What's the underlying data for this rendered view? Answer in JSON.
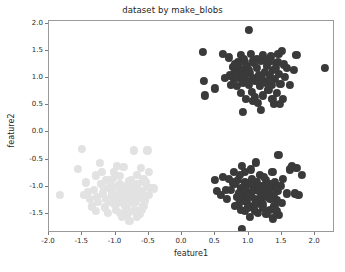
{
  "figure": {
    "width": 345,
    "height": 272,
    "background": "#ffffff"
  },
  "chart_data": {
    "type": "scatter",
    "title": "dataset by make_blobs",
    "xlabel": "feature1",
    "ylabel": "feature2",
    "xlim": [
      -2.0,
      2.3
    ],
    "ylim": [
      -1.85,
      2.05
    ],
    "grid": false,
    "legend": null,
    "xticks": [
      -2.0,
      -1.5,
      -1.0,
      -0.5,
      0.0,
      0.5,
      1.0,
      1.5,
      2.0
    ],
    "xticklabels": [
      "-2.0",
      "-1.5",
      "-1.0",
      "-0.5",
      "0.0",
      "0.5",
      "1.0",
      "1.5",
      "2.0"
    ],
    "yticks": [
      -1.5,
      -1.0,
      -0.5,
      0.0,
      0.5,
      1.0,
      1.5,
      2.0
    ],
    "yticklabels": [
      "-1.5",
      "-1.0",
      "-0.5",
      "0.0",
      "0.5",
      "1.0",
      "1.5",
      "2.0"
    ],
    "marker_size": 8.2,
    "series": [
      {
        "name": "cluster-0",
        "color": "#e2e2e2",
        "center": [
          -1.0,
          -1.05
        ],
        "points": [
          [
            -1.5,
            -0.3
          ],
          [
            -1.84,
            -1.15
          ],
          [
            -1.56,
            -0.67
          ],
          [
            -1.42,
            -1.1
          ],
          [
            -1.3,
            -0.79
          ],
          [
            -1.24,
            -0.56
          ],
          [
            -1.18,
            -1.02
          ],
          [
            -1.14,
            -1.22
          ],
          [
            -1.1,
            -0.88
          ],
          [
            -1.06,
            -1.12
          ],
          [
            -1.02,
            -0.72
          ],
          [
            -0.99,
            -1.0
          ],
          [
            -0.96,
            -1.3
          ],
          [
            -0.93,
            -0.95
          ],
          [
            -0.9,
            -1.18
          ],
          [
            -0.88,
            -0.64
          ],
          [
            -0.86,
            -1.05
          ],
          [
            -0.83,
            -1.42
          ],
          [
            -0.8,
            -0.9
          ],
          [
            -0.78,
            -1.12
          ],
          [
            -0.75,
            -1.3
          ],
          [
            -0.72,
            -0.33
          ],
          [
            -0.7,
            -1.0
          ],
          [
            -0.68,
            -0.78
          ],
          [
            -0.65,
            -1.2
          ],
          [
            -0.62,
            -0.65
          ],
          [
            -0.6,
            -1.07
          ],
          [
            -0.58,
            -1.35
          ],
          [
            -0.55,
            -0.92
          ],
          [
            -0.52,
            -0.33
          ],
          [
            -0.5,
            -1.15
          ],
          [
            -0.47,
            -1.02
          ],
          [
            -0.42,
            -1.03
          ],
          [
            -1.36,
            -1.36
          ],
          [
            -1.28,
            -1.18
          ],
          [
            -1.22,
            -0.95
          ],
          [
            -1.16,
            -1.38
          ],
          [
            -1.08,
            -1.28
          ],
          [
            -1.04,
            -0.86
          ],
          [
            -1.0,
            -1.42
          ],
          [
            -0.97,
            -1.15
          ],
          [
            -0.94,
            -0.8
          ],
          [
            -0.91,
            -1.55
          ],
          [
            -0.87,
            -1.3
          ],
          [
            -0.84,
            -0.98
          ],
          [
            -0.81,
            -1.2
          ],
          [
            -0.79,
            -1.62
          ],
          [
            -0.76,
            -1.05
          ],
          [
            -0.73,
            -1.45
          ],
          [
            -0.7,
            -1.28
          ],
          [
            -0.67,
            -0.95
          ],
          [
            -0.64,
            -1.5
          ],
          [
            -0.61,
            -1.12
          ],
          [
            -0.58,
            -0.85
          ],
          [
            -0.56,
            -1.25
          ],
          [
            -0.53,
            -1.0
          ],
          [
            -1.45,
            -0.92
          ],
          [
            -1.33,
            -1.05
          ],
          [
            -1.26,
            -1.28
          ],
          [
            -1.2,
            -0.72
          ],
          [
            -1.12,
            -1.48
          ],
          [
            -1.05,
            -1.2
          ],
          [
            -0.98,
            -0.62
          ],
          [
            -0.92,
            -1.08
          ],
          [
            -0.85,
            -1.35
          ],
          [
            -0.77,
            -0.88
          ],
          [
            -0.69,
            -1.42
          ],
          [
            -0.63,
            -1.18
          ],
          [
            -1.38,
            -1.22
          ],
          [
            -1.15,
            -0.88
          ],
          [
            -1.02,
            -1.32
          ],
          [
            -0.89,
            -1.0
          ],
          [
            -0.82,
            -1.5
          ],
          [
            -0.74,
            -1.2
          ],
          [
            -0.66,
            -1.08
          ],
          [
            -0.6,
            -1.42
          ],
          [
            -1.1,
            -1.02
          ],
          [
            -0.95,
            -1.25
          ],
          [
            -0.86,
            -1.15
          ],
          [
            -0.71,
            -1.12
          ],
          [
            -1.19,
            -1.12
          ],
          [
            -1.07,
            -0.98
          ],
          [
            -0.93,
            -1.48
          ],
          [
            -0.8,
            -1.05
          ],
          [
            -0.68,
            -1.55
          ],
          [
            -1.3,
            -1.45
          ],
          [
            -1.47,
            -1.15
          ],
          [
            -0.5,
            -0.72
          ]
        ]
      },
      {
        "name": "cluster-1",
        "color": "#3a3a3a",
        "center": [
          1.05,
          1.0
        ],
        "points": [
          [
            0.32,
            1.48
          ],
          [
            0.33,
            0.95
          ],
          [
            0.35,
            0.68
          ],
          [
            0.5,
            0.81
          ],
          [
            0.62,
            1.45
          ],
          [
            0.72,
            1.05
          ],
          [
            0.76,
            1.2
          ],
          [
            0.78,
            0.98
          ],
          [
            0.8,
            1.12
          ],
          [
            0.82,
            0.86
          ],
          [
            0.84,
            1.3
          ],
          [
            0.86,
            1.0
          ],
          [
            0.88,
            0.72
          ],
          [
            0.9,
            1.15
          ],
          [
            0.92,
            0.92
          ],
          [
            0.93,
            1.35
          ],
          [
            0.95,
            1.05
          ],
          [
            0.96,
            0.62
          ],
          [
            0.98,
            1.22
          ],
          [
            1.0,
            0.88
          ],
          [
            1.0,
            1.88
          ],
          [
            1.02,
            1.1
          ],
          [
            1.03,
            1.45
          ],
          [
            1.05,
            0.75
          ],
          [
            1.06,
            1.0
          ],
          [
            1.08,
            1.28
          ],
          [
            1.1,
            0.95
          ],
          [
            1.12,
            1.18
          ],
          [
            1.14,
            0.55
          ],
          [
            1.15,
            1.05
          ],
          [
            1.17,
            0.85
          ],
          [
            1.18,
            1.32
          ],
          [
            1.2,
            1.0
          ],
          [
            1.22,
            0.68
          ],
          [
            1.24,
            1.12
          ],
          [
            1.26,
            0.92
          ],
          [
            1.28,
            1.22
          ],
          [
            1.3,
            0.78
          ],
          [
            1.32,
            1.05
          ],
          [
            1.34,
            1.4
          ],
          [
            1.35,
            0.88
          ],
          [
            1.37,
            1.15
          ],
          [
            1.38,
            0.52
          ],
          [
            1.4,
            0.98
          ],
          [
            1.42,
            1.28
          ],
          [
            1.43,
            0.72
          ],
          [
            1.45,
            1.45
          ],
          [
            1.46,
            1.08
          ],
          [
            1.48,
            0.9
          ],
          [
            1.5,
            1.5
          ],
          [
            1.52,
            0.62
          ],
          [
            1.55,
            1.02
          ],
          [
            1.58,
            1.18
          ],
          [
            1.62,
            0.88
          ],
          [
            1.68,
            1.15
          ],
          [
            1.72,
            1.42
          ],
          [
            2.15,
            1.18
          ],
          [
            0.7,
            1.38
          ],
          [
            0.88,
            1.42
          ],
          [
            1.12,
            1.35
          ],
          [
            0.74,
            0.88
          ],
          [
            0.86,
            1.2
          ],
          [
            0.95,
            1.3
          ],
          [
            1.06,
            0.58
          ],
          [
            1.18,
            0.42
          ],
          [
            0.92,
            0.38
          ],
          [
            1.25,
            1.35
          ],
          [
            1.44,
            1.3
          ],
          [
            0.8,
            1.25
          ],
          [
            1.0,
            1.15
          ],
          [
            1.1,
            0.65
          ],
          [
            1.3,
            1.3
          ],
          [
            0.83,
            1.05
          ],
          [
            0.97,
            0.95
          ],
          [
            1.07,
            1.32
          ],
          [
            1.16,
            0.95
          ],
          [
            1.36,
            0.62
          ],
          [
            1.47,
            0.52
          ],
          [
            1.53,
            1.25
          ],
          [
            0.65,
            1.0
          ],
          [
            1.22,
            1.42
          ],
          [
            1.41,
            1.18
          ],
          [
            0.91,
            1.08
          ],
          [
            1.31,
            0.95
          ]
        ]
      },
      {
        "name": "cluster-2",
        "color": "#3a3a3a",
        "center": [
          1.1,
          -1.0
        ],
        "points": [
          [
            0.5,
            -0.88
          ],
          [
            0.52,
            -1.08
          ],
          [
            0.58,
            -1.15
          ],
          [
            0.62,
            -0.82
          ],
          [
            0.7,
            -0.85
          ],
          [
            0.74,
            -1.05
          ],
          [
            0.78,
            -0.72
          ],
          [
            0.8,
            -0.95
          ],
          [
            0.82,
            -1.18
          ],
          [
            0.84,
            -0.88
          ],
          [
            0.86,
            -1.32
          ],
          [
            0.88,
            -1.02
          ],
          [
            0.9,
            -0.62
          ],
          [
            0.9,
            -1.78
          ],
          [
            0.92,
            -1.15
          ],
          [
            0.94,
            -0.92
          ],
          [
            0.95,
            -1.45
          ],
          [
            0.96,
            -1.05
          ],
          [
            0.98,
            -1.28
          ],
          [
            1.0,
            -0.95
          ],
          [
            1.02,
            -1.55
          ],
          [
            1.03,
            -1.12
          ],
          [
            1.05,
            -0.85
          ],
          [
            1.06,
            -1.35
          ],
          [
            1.08,
            -1.0
          ],
          [
            1.1,
            -1.22
          ],
          [
            1.12,
            -0.92
          ],
          [
            1.14,
            -1.48
          ],
          [
            1.15,
            -1.08
          ],
          [
            1.17,
            -0.78
          ],
          [
            1.18,
            -1.25
          ],
          [
            1.2,
            -0.98
          ],
          [
            1.22,
            -1.38
          ],
          [
            1.24,
            -1.05
          ],
          [
            1.26,
            -0.88
          ],
          [
            1.28,
            -1.18
          ],
          [
            1.3,
            -0.95
          ],
          [
            1.32,
            -1.42
          ],
          [
            1.34,
            -1.02
          ],
          [
            1.36,
            -0.72
          ],
          [
            1.38,
            -1.15
          ],
          [
            1.4,
            -0.92
          ],
          [
            1.42,
            -1.45
          ],
          [
            1.44,
            -1.08
          ],
          [
            1.45,
            -0.42
          ],
          [
            1.46,
            -1.52
          ],
          [
            1.48,
            -0.98
          ],
          [
            1.5,
            -1.3
          ],
          [
            1.52,
            -0.85
          ],
          [
            1.58,
            -1.12
          ],
          [
            1.62,
            -0.68
          ],
          [
            1.65,
            -0.62
          ],
          [
            1.7,
            -1.12
          ],
          [
            1.72,
            -0.65
          ],
          [
            1.75,
            -1.15
          ],
          [
            1.8,
            -0.78
          ],
          [
            0.66,
            -1.05
          ],
          [
            0.68,
            -1.22
          ],
          [
            0.76,
            -0.92
          ],
          [
            0.85,
            -1.12
          ],
          [
            0.88,
            -1.42
          ],
          [
            0.93,
            -1.25
          ],
          [
            0.99,
            -1.38
          ],
          [
            1.04,
            -0.68
          ],
          [
            1.09,
            -1.45
          ],
          [
            1.13,
            -1.32
          ],
          [
            1.19,
            -1.12
          ],
          [
            1.23,
            -0.82
          ],
          [
            1.27,
            -1.5
          ],
          [
            1.33,
            -1.22
          ],
          [
            1.39,
            -1.35
          ],
          [
            1.43,
            -1.25
          ],
          [
            0.95,
            -0.72
          ],
          [
            1.01,
            -1.18
          ],
          [
            1.07,
            -1.08
          ],
          [
            1.16,
            -1.02
          ],
          [
            1.21,
            -1.32
          ],
          [
            1.29,
            -1.08
          ],
          [
            1.35,
            -0.95
          ],
          [
            1.41,
            -1.02
          ],
          [
            0.8,
            -1.35
          ],
          [
            0.87,
            -0.78
          ],
          [
            1.11,
            -0.55
          ],
          [
            1.37,
            -1.58
          ]
        ]
      }
    ]
  }
}
